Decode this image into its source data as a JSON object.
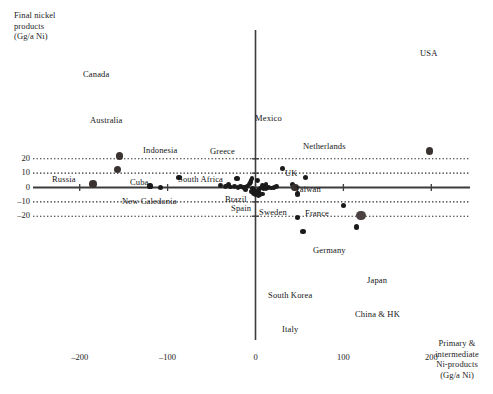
{
  "chart_data": {
    "type": "scatter",
    "title": "",
    "xlabel": "Primary & intermediate Ni-products (Gg/a Ni)",
    "ylabel": "Final nickel products (Gg/a Ni)",
    "xlim": [
      -235,
      245
    ],
    "ylim": [
      -26,
      28
    ],
    "xticks": [
      -200,
      -100,
      0,
      100,
      200
    ],
    "yticks": [
      20,
      10,
      0,
      -10,
      -20
    ],
    "grid": "horizontal-dotted",
    "legend": "none",
    "points": [
      {
        "label": "USA",
        "x": 198,
        "y": 25.5,
        "size": "mid",
        "lx": 420,
        "ly": 48
      },
      {
        "label": "Canada",
        "x": -155,
        "y": 22.0,
        "size": "mid",
        "lx": 83,
        "ly": 69
      },
      {
        "label": "Australia",
        "x": -157,
        "y": 12.5,
        "size": "mid",
        "lx": 90,
        "ly": 115
      },
      {
        "label": "Mexico",
        "x": 31,
        "y": 13.0,
        "size": "small",
        "lx": 255,
        "ly": 113
      },
      {
        "label": "Netherlands",
        "x": 57,
        "y": 7.0,
        "size": "small",
        "lx": 303,
        "ly": 141
      },
      {
        "label": "Indonesia",
        "x": -87,
        "y": 6.8,
        "size": "small",
        "lx": 143,
        "ly": 145
      },
      {
        "label": "Greece",
        "x": -21,
        "y": 6.2,
        "size": "small",
        "lx": 210,
        "ly": 146
      },
      {
        "label": "South Africa",
        "x": -31,
        "y": 2.0,
        "size": "small",
        "lx": 178,
        "ly": 174
      },
      {
        "label": "Russia",
        "x": -185,
        "y": 2.3,
        "size": "mid",
        "lx": 52,
        "ly": 174
      },
      {
        "label": "Cuba",
        "x": -120,
        "y": 1.0,
        "size": "small",
        "lx": 130,
        "ly": 177
      },
      {
        "label": "New Caledonia",
        "x": -108,
        "y": 0.0,
        "size": "small",
        "lx": 122,
        "ly": 196
      },
      {
        "label": "UK",
        "x": 42,
        "y": 2.2,
        "size": "small",
        "lx": 285,
        "ly": 168
      },
      {
        "label": "Taiwan",
        "x": 45,
        "y": 0.0,
        "size": "mid",
        "lx": 295,
        "ly": 184
      },
      {
        "label": "Brazil",
        "x": -11,
        "y": -1.2,
        "size": "small",
        "lx": 225,
        "ly": 194
      },
      {
        "label": "Spain",
        "x": -5,
        "y": -3.0,
        "size": "small",
        "lx": 231,
        "ly": 203
      },
      {
        "label": "Sweden",
        "x": 5,
        "y": -4.0,
        "size": "small",
        "lx": 259,
        "ly": 207
      },
      {
        "label": "France",
        "x": 48,
        "y": -4.5,
        "size": "small",
        "lx": 305,
        "ly": 208
      },
      {
        "label": "Germany",
        "x": 100,
        "y": -12.5,
        "size": "small",
        "lx": 313,
        "ly": 245
      },
      {
        "label": "Japan",
        "x": 120,
        "y": -19.5,
        "size": "big",
        "lx": 367,
        "ly": 275
      },
      {
        "label": "South Korea",
        "x": 48,
        "y": -21.0,
        "size": "small",
        "lx": 268,
        "ly": 290
      },
      {
        "label": "China & HK",
        "x": 115,
        "y": -27.5,
        "size": "small",
        "lx": 355,
        "ly": 309
      },
      {
        "label": "Italy",
        "x": 54,
        "y": -30.5,
        "size": "small",
        "lx": 282,
        "ly": 324
      }
    ],
    "cluster_points": [
      {
        "x": -40,
        "y": 1.2
      },
      {
        "x": -34,
        "y": 0.6
      },
      {
        "x": -28,
        "y": 0.4
      },
      {
        "x": -24,
        "y": 0.9
      },
      {
        "x": -20,
        "y": 0.2
      },
      {
        "x": -17,
        "y": 0.5
      },
      {
        "x": -14,
        "y": -0.2
      },
      {
        "x": -11,
        "y": 0.3
      },
      {
        "x": -9,
        "y": 1.1
      },
      {
        "x": -7,
        "y": 2.4
      },
      {
        "x": -6,
        "y": 3.6
      },
      {
        "x": -5,
        "y": 4.8
      },
      {
        "x": -4,
        "y": 6.0
      },
      {
        "x": 2,
        "y": 5.0
      },
      {
        "x": -3,
        "y": -0.6
      },
      {
        "x": -2,
        "y": -1.6
      },
      {
        "x": -1,
        "y": -2.6
      },
      {
        "x": 0,
        "y": -3.4
      },
      {
        "x": 1,
        "y": -4.2
      },
      {
        "x": 2,
        "y": -3.0
      },
      {
        "x": 3,
        "y": -2.0
      },
      {
        "x": 4,
        "y": -1.0
      },
      {
        "x": 6,
        "y": -0.4
      },
      {
        "x": 9,
        "y": -0.8
      },
      {
        "x": 12,
        "y": -0.5
      },
      {
        "x": 15,
        "y": 0.0
      },
      {
        "x": 18,
        "y": -0.3
      },
      {
        "x": 21,
        "y": 0.2
      },
      {
        "x": 5,
        "y": -5.2
      },
      {
        "x": 8,
        "y": -4.6
      },
      {
        "x": 3,
        "y": -5.8
      },
      {
        "x": 0,
        "y": -5.0
      },
      {
        "x": -2,
        "y": -4.4
      },
      {
        "x": 24,
        "y": 0.6
      },
      {
        "x": 12,
        "y": 2.0
      },
      {
        "x": 8,
        "y": 1.4
      }
    ]
  },
  "axes": {
    "y_title": "Final nickel\nproducts\n(Gg/a Ni)",
    "x_title": "Primary &\nintermediate\nNi-products\n(Gg/a Ni)",
    "x_tick_labels": [
      "–200",
      "–100",
      "0",
      "100",
      "200"
    ],
    "y_tick_labels": [
      "20",
      "10",
      "0",
      "–10",
      "–20"
    ]
  },
  "colors": {
    "marker": "#1b1b1b",
    "marker_large": "#4a4140",
    "axis": "#3c3c3c",
    "grid": "#2b2b2b",
    "text": "#1a1a1a",
    "background": "#ffffff"
  }
}
